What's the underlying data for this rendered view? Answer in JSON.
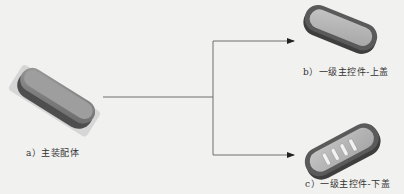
{
  "diagram": {
    "nodes": [
      {
        "id": "a",
        "label": "a）主装配体",
        "shape": "assembly"
      },
      {
        "id": "b",
        "label": "b）一级主控件-上盖",
        "shape": "upper-cover"
      },
      {
        "id": "c",
        "label": "c）一级主控件-下盖",
        "shape": "lower-cover"
      }
    ],
    "edges": [
      {
        "from": "a",
        "to": "b"
      },
      {
        "from": "a",
        "to": "c"
      }
    ],
    "colors": {
      "background": "#f1f1ef",
      "line": "#6e6e6e",
      "arrow": "#222222",
      "part_dark": "#4a4a4a",
      "part_mid": "#8a8a8a",
      "part_light": "#b8b8b8"
    }
  }
}
